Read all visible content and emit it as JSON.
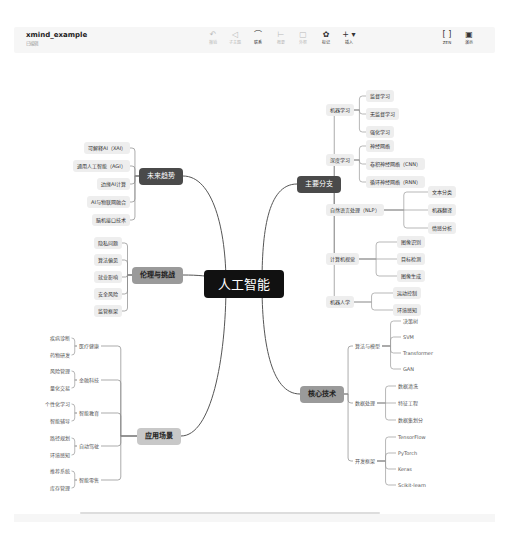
{
  "header": {
    "title": "xmind_example",
    "subtitle": "已编辑",
    "toolbar": [
      {
        "name": "undo",
        "icon": "undo-icon",
        "glyph": "↶",
        "label": "撤销",
        "active": false,
        "x": 213
      },
      {
        "name": "redo",
        "icon": "redo-icon",
        "glyph": "◁",
        "label": "子主题",
        "active": false,
        "x": 235
      },
      {
        "name": "relation",
        "icon": "relation-icon",
        "glyph": "⌒",
        "label": "联系",
        "active": true,
        "x": 258
      },
      {
        "name": "summary",
        "icon": "summary-icon",
        "glyph": "⊢",
        "label": "概要",
        "active": false,
        "x": 281
      },
      {
        "name": "boundary",
        "icon": "boundary-icon",
        "glyph": "▢",
        "label": "外框",
        "active": false,
        "x": 303
      },
      {
        "name": "marker",
        "icon": "marker-icon",
        "glyph": "✿",
        "label": "标记",
        "active": true,
        "x": 326
      },
      {
        "name": "insert",
        "icon": "plus-icon",
        "glyph": "+ ▾",
        "label": "插入",
        "active": true,
        "x": 349
      }
    ],
    "right_tools": [
      {
        "name": "zen",
        "icon": "fullscreen-icon",
        "glyph": "[ ]",
        "label": "ZEN",
        "x": 447
      },
      {
        "name": "present",
        "icon": "present-icon",
        "glyph": "▣",
        "label": "演示",
        "x": 469
      }
    ]
  },
  "mindmap": {
    "root": {
      "label": "人工智能",
      "x": 204,
      "y": 228
    },
    "branches": [
      {
        "label": "主要分支",
        "style": "main-dark",
        "x": 297,
        "y": 128,
        "side": "right",
        "children": [
          {
            "label": "机器学习",
            "x": 326,
            "y": 54,
            "children": [
              {
                "label": "监督学习",
                "x": 366,
                "y": 40
              },
              {
                "label": "无监督学习",
                "x": 366,
                "y": 58
              },
              {
                "label": "强化学习",
                "x": 366,
                "y": 76
              }
            ]
          },
          {
            "label": "深度学习",
            "x": 326,
            "y": 104,
            "children": [
              {
                "label": "神经网络",
                "x": 366,
                "y": 90
              },
              {
                "label": "卷积神经网络（CNN）",
                "x": 366,
                "y": 108
              },
              {
                "label": "循环神经网络（RNN）",
                "x": 366,
                "y": 126
              }
            ]
          },
          {
            "label": "自然语言处理（NLP）",
            "x": 326,
            "y": 154,
            "children": [
              {
                "label": "文本分类",
                "x": 428,
                "y": 136
              },
              {
                "label": "机器翻译",
                "x": 428,
                "y": 154
              },
              {
                "label": "情感分析",
                "x": 428,
                "y": 172
              }
            ]
          },
          {
            "label": "计算机视觉",
            "x": 326,
            "y": 203,
            "children": [
              {
                "label": "图像识别",
                "x": 397,
                "y": 186
              },
              {
                "label": "目标检测",
                "x": 397,
                "y": 203
              },
              {
                "label": "图像生成",
                "x": 397,
                "y": 220
              }
            ]
          },
          {
            "label": "机器人学",
            "x": 326,
            "y": 246,
            "children": [
              {
                "label": "运动控制",
                "x": 393,
                "y": 237
              },
              {
                "label": "环境感知",
                "x": 393,
                "y": 254
              }
            ]
          }
        ]
      },
      {
        "label": "核心技术",
        "style": "main-gray",
        "x": 300,
        "y": 338,
        "side": "right",
        "children": [
          {
            "label": "算法与模型",
            "x": 353,
            "y": 290,
            "children": [
              {
                "label": "决策树",
                "x": 401,
                "y": 265
              },
              {
                "label": "SVM",
                "x": 401,
                "y": 281
              },
              {
                "label": "Transformer",
                "x": 401,
                "y": 297
              },
              {
                "label": "GAN",
                "x": 401,
                "y": 313
              }
            ]
          },
          {
            "label": "数据处理",
            "x": 353,
            "y": 347,
            "children": [
              {
                "label": "数据清洗",
                "x": 396,
                "y": 330
              },
              {
                "label": "特征工程",
                "x": 396,
                "y": 347
              },
              {
                "label": "数据集划分",
                "x": 396,
                "y": 364
              }
            ]
          },
          {
            "label": "开发框架",
            "x": 353,
            "y": 405,
            "children": [
              {
                "label": "TensorFlow",
                "x": 396,
                "y": 381
              },
              {
                "label": "PyTorch",
                "x": 396,
                "y": 397
              },
              {
                "label": "Keras",
                "x": 396,
                "y": 413
              },
              {
                "label": "Scikit-learn",
                "x": 396,
                "y": 429
              }
            ]
          }
        ]
      },
      {
        "label": "未来趋势",
        "style": "main-dark",
        "x": 139,
        "y": 120,
        "side": "left",
        "children": [
          {
            "label": "可解释AI（XAI）",
            "x": 130,
            "y": 92
          },
          {
            "label": "通用人工智能（AGI）",
            "x": 130,
            "y": 110
          },
          {
            "label": "边缘AI计算",
            "x": 130,
            "y": 128
          },
          {
            "label": "AI与物联网融合",
            "x": 130,
            "y": 146
          },
          {
            "label": "脑机接口技术",
            "x": 130,
            "y": 164
          }
        ]
      },
      {
        "label": "伦理与挑战",
        "style": "main-gray",
        "x": 132,
        "y": 219,
        "side": "left",
        "children": [
          {
            "label": "隐私问题",
            "x": 122,
            "y": 187
          },
          {
            "label": "算法偏见",
            "x": 122,
            "y": 204
          },
          {
            "label": "就业影响",
            "x": 122,
            "y": 221
          },
          {
            "label": "安全风险",
            "x": 122,
            "y": 238
          },
          {
            "label": "监管框架",
            "x": 122,
            "y": 255
          }
        ]
      },
      {
        "label": "应用场景",
        "style": "main-light",
        "x": 137,
        "y": 380,
        "side": "left",
        "children": [
          {
            "label": "医疗健康",
            "x": 101,
            "y": 290,
            "children": [
              {
                "label": "疾病诊断",
                "x": 92,
                "y": 282
              },
              {
                "label": "药物研发",
                "x": 92,
                "y": 299
              }
            ]
          },
          {
            "label": "金融科技",
            "x": 101,
            "y": 324,
            "children": [
              {
                "label": "风险管理",
                "x": 92,
                "y": 315
              },
              {
                "label": "量化交易",
                "x": 92,
                "y": 332
              }
            ]
          },
          {
            "label": "智能教育",
            "x": 101,
            "y": 357,
            "children": [
              {
                "label": "个性化学习",
                "x": 92,
                "y": 348
              },
              {
                "label": "智能辅导",
                "x": 92,
                "y": 365
              }
            ]
          },
          {
            "label": "自动驾驶",
            "x": 101,
            "y": 390,
            "children": [
              {
                "label": "路径规划",
                "x": 92,
                "y": 382
              },
              {
                "label": "环境感知",
                "x": 92,
                "y": 399
              }
            ]
          },
          {
            "label": "智能零售",
            "x": 101,
            "y": 424,
            "children": [
              {
                "label": "推荐系统",
                "x": 92,
                "y": 415
              },
              {
                "label": "库存管理",
                "x": 92,
                "y": 432
              }
            ]
          }
        ]
      }
    ]
  },
  "colors": {
    "root_bg": "#111111",
    "main_dark_bg": "#4a4a4a",
    "main_gray_bg": "#9a9a9a",
    "main_light_bg": "#c8c8c8",
    "leaf_bg": "#eeeeee",
    "line": "#777777",
    "leaf_line": "#999999"
  }
}
